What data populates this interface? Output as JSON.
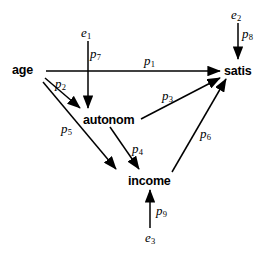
{
  "diagram": {
    "type": "path-diagram",
    "title": "",
    "nodes": [
      {
        "id": "age",
        "label": "age",
        "x": 12,
        "y": 63,
        "kind": "observed"
      },
      {
        "id": "autonom",
        "label": "autonom",
        "x": 83,
        "y": 113,
        "kind": "observed"
      },
      {
        "id": "income",
        "label": "income",
        "x": 128,
        "y": 174,
        "kind": "observed"
      },
      {
        "id": "satis",
        "label": "satis",
        "x": 224,
        "y": 64,
        "kind": "observed"
      },
      {
        "id": "e1",
        "label": "e",
        "sub": "1",
        "x": 81,
        "y": 25,
        "kind": "error"
      },
      {
        "id": "e2",
        "label": "e",
        "sub": "2",
        "x": 231,
        "y": 7,
        "kind": "error"
      },
      {
        "id": "e3",
        "label": "e",
        "sub": "3",
        "x": 145,
        "y": 230,
        "kind": "error"
      }
    ],
    "edges": [
      {
        "id": "p1",
        "label": "p",
        "sub": "1",
        "from": "age",
        "to": "satis",
        "label_x": 144,
        "label_y": 53
      },
      {
        "id": "p2",
        "label": "p",
        "sub": "2",
        "from": "age",
        "to": "autonom",
        "label_x": 55,
        "label_y": 76
      },
      {
        "id": "p3",
        "label": "p",
        "sub": "3",
        "from": "autonom",
        "to": "satis",
        "label_x": 162,
        "label_y": 88
      },
      {
        "id": "p4",
        "label": "p",
        "sub": "4",
        "from": "autonom",
        "to": "income",
        "label_x": 132,
        "label_y": 141
      },
      {
        "id": "p5",
        "label": "p",
        "sub": "5",
        "from": "age",
        "to": "income",
        "label_x": 61,
        "label_y": 121
      },
      {
        "id": "p6",
        "label": "p",
        "sub": "6",
        "from": "income",
        "to": "satis",
        "label_x": 200,
        "label_y": 126
      },
      {
        "id": "p7",
        "label": "p",
        "sub": "7",
        "from": "e1",
        "to": "autonom",
        "label_x": 90,
        "label_y": 46
      },
      {
        "id": "p8",
        "label": "p",
        "sub": "8",
        "from": "e2",
        "to": "satis",
        "label_x": 242,
        "label_y": 26
      },
      {
        "id": "p9",
        "label": "p",
        "sub": "9",
        "from": "e3",
        "to": "income",
        "label_x": 156,
        "label_y": 203
      }
    ],
    "style": {
      "line_color": "#000000",
      "text_color": "#000000",
      "background": "#ffffff"
    }
  }
}
